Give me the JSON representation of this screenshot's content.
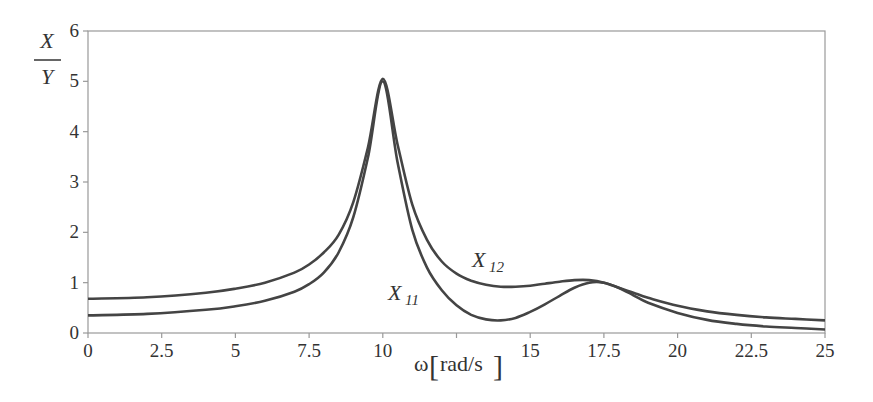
{
  "chart_data": {
    "type": "line",
    "title": "",
    "xlabel": "ω[rad/s]",
    "ylabel": {
      "numerator": "X",
      "denominator": "Y"
    },
    "xlim": [
      0,
      25
    ],
    "ylim": [
      0,
      6
    ],
    "xticks": [
      0,
      2.5,
      5,
      7.5,
      10,
      12.5,
      15,
      17.5,
      20,
      22.5,
      25
    ],
    "xtick_labels": [
      "0",
      "2.5",
      "5",
      "7.5",
      "10",
      "",
      "15",
      "17.5",
      "20",
      "22.5",
      "25"
    ],
    "yticks": [
      0,
      1,
      2,
      3,
      4,
      5,
      6
    ],
    "ytick_labels": [
      "0",
      "1",
      "2",
      "3",
      "4",
      "5",
      "6"
    ],
    "grid": false,
    "legend": "inline annotations",
    "series": [
      {
        "name": "X11",
        "label_main": "X",
        "label_sub": "11",
        "x": [
          0,
          2,
          4,
          5,
          6,
          7,
          7.5,
          8,
          8.5,
          9,
          9.5,
          10,
          10.5,
          11,
          11.5,
          12,
          12.5,
          13,
          13.5,
          14,
          14.5,
          15,
          15.5,
          16,
          16.5,
          17,
          17.5,
          18,
          18.5,
          19,
          20,
          21,
          22,
          23,
          24,
          25
        ],
        "values": [
          0.35,
          0.38,
          0.46,
          0.53,
          0.64,
          0.82,
          0.97,
          1.2,
          1.6,
          2.3,
          3.5,
          5.0,
          3.4,
          2.05,
          1.3,
          0.85,
          0.55,
          0.36,
          0.27,
          0.25,
          0.3,
          0.42,
          0.57,
          0.74,
          0.9,
          1.0,
          1.0,
          0.9,
          0.75,
          0.6,
          0.4,
          0.26,
          0.18,
          0.13,
          0.1,
          0.07
        ]
      },
      {
        "name": "X12",
        "label_main": "X",
        "label_sub": "12",
        "x": [
          0,
          2,
          4,
          5,
          6,
          7,
          7.5,
          8,
          8.5,
          9,
          9.5,
          10,
          10.5,
          11,
          11.5,
          12,
          12.5,
          13,
          13.5,
          14,
          14.5,
          15,
          15.5,
          16,
          16.5,
          17,
          17.5,
          18,
          18.5,
          19,
          20,
          21,
          22,
          23,
          24,
          25
        ],
        "values": [
          0.68,
          0.71,
          0.8,
          0.88,
          1.0,
          1.2,
          1.36,
          1.6,
          1.95,
          2.6,
          3.7,
          5.05,
          3.75,
          2.55,
          1.85,
          1.42,
          1.18,
          1.04,
          0.96,
          0.92,
          0.92,
          0.94,
          0.98,
          1.02,
          1.05,
          1.05,
          1.0,
          0.9,
          0.8,
          0.7,
          0.54,
          0.43,
          0.36,
          0.31,
          0.28,
          0.25
        ]
      }
    ],
    "annotations": [
      {
        "text": "X12",
        "x": 13.2,
        "y": 1.35
      },
      {
        "text": "X11",
        "x": 10.5,
        "y": 0.75
      }
    ]
  },
  "colors": {
    "line": "#444444",
    "axis": "#999999",
    "text": "#333333",
    "background": "#ffffff"
  },
  "labels": {
    "ylabel_num": "X",
    "ylabel_den": "Y",
    "xlabel_omega": "ω",
    "xlabel_unit": "rad/s",
    "x12_main": "X",
    "x12_sub": "12",
    "x11_main": "X",
    "x11_sub": "11"
  }
}
